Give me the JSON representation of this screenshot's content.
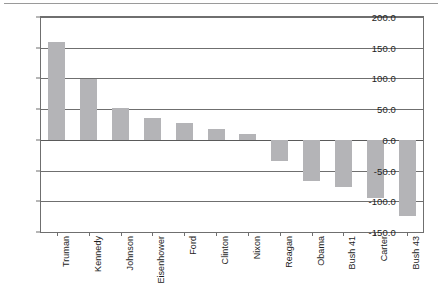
{
  "chart_data": {
    "type": "bar",
    "title": "",
    "subtitle": "",
    "xlabel": "",
    "ylabel": "",
    "categories": [
      "Truman",
      "Kennedy",
      "Johnson",
      "Eisenhower",
      "Ford",
      "Clinton",
      "Nixon",
      "Reagan",
      "Obama",
      "Bush 41",
      "Carter",
      "Bush 43"
    ],
    "values": [
      159.0,
      99.0,
      52.0,
      36.0,
      28.0,
      18.0,
      9.0,
      -35.0,
      -67.0,
      -77.0,
      -95.0,
      -124.0
    ],
    "ylim": [
      -150.0,
      200.0
    ],
    "ytick_labels": [
      "200.0",
      "150.0",
      "100.0",
      "50.0",
      "0.0",
      "-50.0",
      "-100.0",
      "-150.0"
    ],
    "ytick_values": [
      200.0,
      150.0,
      100.0,
      50.0,
      0.0,
      -50.0,
      -100.0,
      -150.0
    ],
    "grid": true,
    "grid_axis": "y",
    "legend": false,
    "legend_position": "none",
    "bar_color": "#b4b4b7",
    "axis_color": "#6f6f6f",
    "text_color": "#1c1c1c",
    "background": "#ffffff",
    "zero_line": 0.0,
    "orientation": "vertical",
    "label_rotation": 90
  }
}
